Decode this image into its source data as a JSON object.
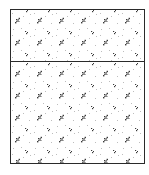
{
  "diagram": {
    "type": "section-hatch",
    "hatch_pattern": "concrete-stipple",
    "frame": {
      "x": 10,
      "y": 9,
      "width": 135,
      "height": 155,
      "stroke": "#2a2a2a"
    },
    "divider_y": 61,
    "panels": [
      {
        "id": "upper",
        "label": "",
        "height": 52
      },
      {
        "id": "lower",
        "label": "",
        "height": 103
      }
    ],
    "colors": {
      "stroke": "#2a2a2a",
      "fill": "#ffffff",
      "hatch_dark": "#3a3a3a",
      "hatch_light": "#bdbdbd"
    }
  }
}
